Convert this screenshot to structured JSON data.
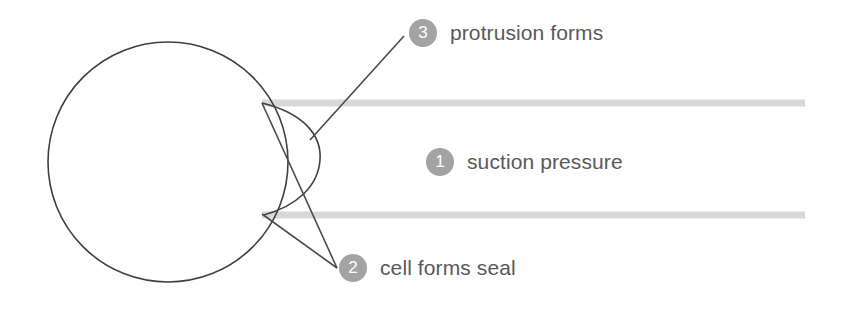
{
  "diagram": {
    "colors": {
      "outline": "#3f3f3f",
      "pipette_wall": "#d8d8d8",
      "badge_fill": "#a3a3a3",
      "badge_text": "#ffffff",
      "label_text": "#58595b",
      "background": "#ffffff"
    },
    "cell": {
      "shape": "circle",
      "center_x": 168,
      "center_y": 162,
      "radius": 120
    },
    "protrusion": {
      "shape": "arc",
      "tip_x": 320,
      "top_y": 103,
      "bottom_y": 215
    },
    "pipette": {
      "upper_wall_y": 103,
      "lower_wall_y": 215,
      "tip_x": 262,
      "end_x": 805,
      "wall_thickness": 7
    }
  },
  "labels": [
    {
      "number": "3",
      "text": "protrusion forms",
      "name": "label-protrusion-forms"
    },
    {
      "number": "1",
      "text": "suction pressure",
      "name": "label-suction-pressure"
    },
    {
      "number": "2",
      "text": "cell forms seal",
      "name": "label-cell-forms-seal"
    }
  ]
}
